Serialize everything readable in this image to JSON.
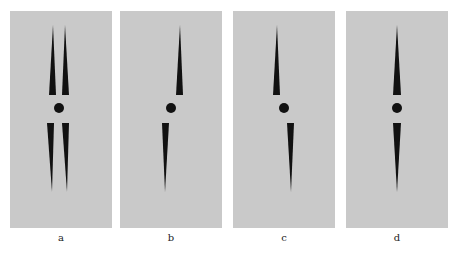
{
  "figure": {
    "background": "#ffffff",
    "panel_background": "#c9c9c9",
    "shape_color": "#111111",
    "panels": [
      {
        "label": "a",
        "description": "two upper spikes and two lower spikes with central dot"
      },
      {
        "label": "b",
        "description": "upper spike right of center, lower spike left of center, central dot"
      },
      {
        "label": "c",
        "description": "upper spike left of center, lower spike right of center, central dot"
      },
      {
        "label": "d",
        "description": "upper and lower spikes aligned with central dot"
      }
    ]
  }
}
